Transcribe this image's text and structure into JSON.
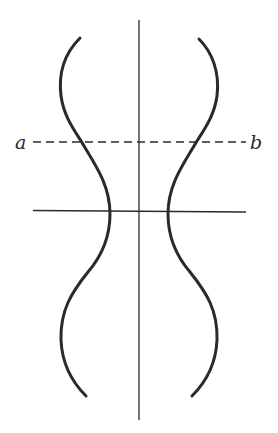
{
  "figure": {
    "type": "symmetric profile diagram",
    "colors": {
      "stroke": "#2a2a2a",
      "background": "#ffffff"
    },
    "labels": {
      "left": "a",
      "right": "b"
    },
    "axis_vertical": {
      "x": 139,
      "y1": 20,
      "y2": 420
    },
    "axis_horizontal": {
      "y": 211,
      "x1": 33,
      "x2": 246
    },
    "section_line": {
      "y": 142,
      "x1": 33,
      "x2": 246,
      "style": "dashed",
      "from_label": "a",
      "to_label": "b"
    },
    "left_curve": {
      "top": [
        80,
        38
      ],
      "upper_bulge": [
        60,
        88
      ],
      "crosses_section": [
        80,
        142
      ],
      "waist": [
        110,
        211
      ],
      "lower_bulge": [
        61,
        340
      ],
      "bottom": [
        86,
        396
      ]
    },
    "right_curve": {
      "top": [
        199,
        39
      ],
      "upper_bulge": [
        217,
        88
      ],
      "crosses_section": [
        197,
        142
      ],
      "waist": [
        168,
        211
      ],
      "lower_bulge": [
        217,
        340
      ],
      "bottom": [
        192,
        396
      ]
    }
  }
}
